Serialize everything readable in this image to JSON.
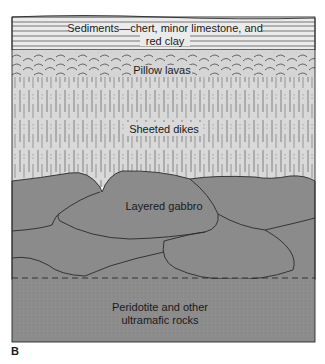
{
  "panel_label": "B",
  "layers": [
    {
      "id": "sediments",
      "label_line1": "Sediments—chert, minor limestone, and",
      "label_line2": "red clay",
      "color": "#ebebeb"
    },
    {
      "id": "pillow-lavas",
      "label": "Pillow lavas",
      "color": "#d5d5d5"
    },
    {
      "id": "sheeted-dikes",
      "label": "Sheeted dikes",
      "color": "#d9d9d9"
    },
    {
      "id": "layered-gabbro",
      "label": "Layered gabbro",
      "color": "#8b8b8b"
    },
    {
      "id": "peridotite",
      "label_line1": "Peridotite and other",
      "label_line2": "ultramafic rocks",
      "color": "#8e8e8e"
    }
  ],
  "colors": {
    "outline": "#2a2a2a",
    "line": "#555555"
  }
}
